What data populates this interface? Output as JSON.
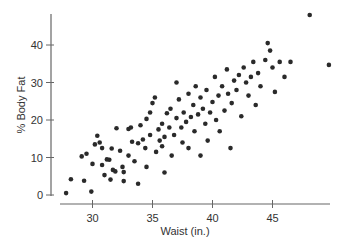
{
  "chart_data": {
    "type": "scatter",
    "title": "",
    "xlabel": "Waist (in.)",
    "ylabel": "% Body Fat",
    "xlim": [
      27.2,
      49.8
    ],
    "ylim": [
      0,
      48
    ],
    "xticks": [
      30,
      35,
      40,
      45
    ],
    "yticks": [
      0,
      10,
      20,
      30,
      40
    ],
    "grid": false,
    "legend": null,
    "point_color": "#2a2a2a",
    "axis_color": "#666666",
    "points": [
      [
        27.8,
        0.5
      ],
      [
        28.2,
        4.2
      ],
      [
        29.1,
        10.3
      ],
      [
        29.5,
        11.0
      ],
      [
        29.3,
        3.8
      ],
      [
        29.9,
        0.9
      ],
      [
        30.0,
        8.3
      ],
      [
        30.8,
        8.0
      ],
      [
        30.2,
        13.5
      ],
      [
        30.4,
        15.8
      ],
      [
        30.6,
        14.0
      ],
      [
        30.8,
        12.5
      ],
      [
        31.2,
        9.5
      ],
      [
        31.4,
        9.4
      ],
      [
        31.5,
        4.1
      ],
      [
        31.0,
        5.3
      ],
      [
        31.7,
        6.7
      ],
      [
        31.9,
        6.3
      ],
      [
        31.6,
        12.4
      ],
      [
        32.0,
        17.8
      ],
      [
        32.3,
        11.8
      ],
      [
        32.5,
        7.5
      ],
      [
        32.6,
        6.1
      ],
      [
        32.6,
        3.7
      ],
      [
        33.0,
        17.6
      ],
      [
        33.2,
        18.0
      ],
      [
        33.0,
        10.5
      ],
      [
        33.3,
        14.2
      ],
      [
        33.5,
        9.0
      ],
      [
        33.8,
        13.8
      ],
      [
        33.8,
        3.0
      ],
      [
        34.0,
        18.6
      ],
      [
        34.2,
        14.8
      ],
      [
        34.4,
        12.5
      ],
      [
        34.5,
        7.5
      ],
      [
        34.8,
        16.0
      ],
      [
        34.5,
        20.3
      ],
      [
        34.8,
        22.0
      ],
      [
        35.0,
        24.5
      ],
      [
        35.2,
        26.0
      ],
      [
        35.3,
        11.5
      ],
      [
        35.5,
        17.5
      ],
      [
        35.6,
        14.5
      ],
      [
        35.8,
        19.0
      ],
      [
        35.8,
        13.0
      ],
      [
        36.0,
        15.5
      ],
      [
        36.0,
        6.0
      ],
      [
        36.2,
        21.8
      ],
      [
        36.4,
        18.0
      ],
      [
        36.5,
        23.0
      ],
      [
        36.6,
        10.5
      ],
      [
        36.8,
        16.0
      ],
      [
        37.0,
        20.5
      ],
      [
        37.0,
        30.0
      ],
      [
        37.2,
        25.5
      ],
      [
        37.4,
        18.0
      ],
      [
        37.5,
        14.0
      ],
      [
        37.6,
        22.0
      ],
      [
        37.8,
        19.5
      ],
      [
        38.0,
        27.0
      ],
      [
        38.0,
        12.5
      ],
      [
        38.2,
        20.8
      ],
      [
        38.4,
        24.0
      ],
      [
        38.5,
        17.0
      ],
      [
        38.6,
        29.0
      ],
      [
        38.8,
        21.5
      ],
      [
        39.0,
        26.0
      ],
      [
        39.0,
        10.5
      ],
      [
        39.2,
        23.0
      ],
      [
        39.4,
        19.0
      ],
      [
        39.5,
        28.0
      ],
      [
        39.6,
        14.5
      ],
      [
        39.8,
        22.0
      ],
      [
        40.0,
        24.8
      ],
      [
        40.2,
        31.5
      ],
      [
        40.3,
        20.0
      ],
      [
        40.5,
        26.5
      ],
      [
        40.6,
        17.0
      ],
      [
        40.8,
        29.0
      ],
      [
        41.0,
        22.5
      ],
      [
        41.2,
        33.5
      ],
      [
        41.3,
        27.0
      ],
      [
        41.5,
        12.5
      ],
      [
        41.6,
        24.5
      ],
      [
        41.8,
        30.5
      ],
      [
        42.0,
        28.0
      ],
      [
        42.2,
        32.0
      ],
      [
        42.4,
        21.0
      ],
      [
        42.6,
        34.0
      ],
      [
        42.8,
        30.0
      ],
      [
        43.0,
        26.5
      ],
      [
        43.2,
        31.5
      ],
      [
        43.4,
        35.5
      ],
      [
        43.6,
        24.0
      ],
      [
        43.8,
        32.5
      ],
      [
        44.0,
        29.0
      ],
      [
        44.4,
        36.0
      ],
      [
        44.6,
        40.5
      ],
      [
        44.8,
        38.5
      ],
      [
        45.0,
        34.0
      ],
      [
        45.2,
        27.5
      ],
      [
        45.6,
        35.5
      ],
      [
        46.0,
        31.5
      ],
      [
        46.5,
        35.5
      ],
      [
        48.1,
        48.0
      ],
      [
        49.7,
        34.7
      ]
    ]
  }
}
